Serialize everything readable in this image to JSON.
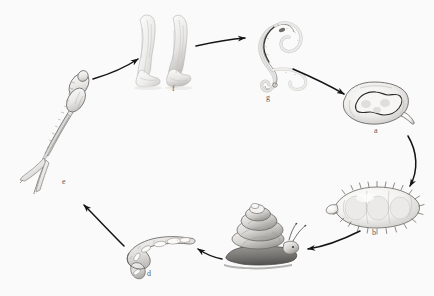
{
  "figure": {
    "background_color": "#fbfafa",
    "ink_color": "#4a4a48",
    "label_color": "#5a5a58",
    "arrow_color": "#1a1a1a",
    "cycle_direction": "clockwise",
    "stage_count": 7
  },
  "stages": [
    {
      "key": "a",
      "label": "a",
      "name": "egg",
      "description": "Operculate egg with miracidium inside",
      "label_x": 374,
      "label_y": 127
    },
    {
      "key": "b",
      "label": "b",
      "name": "miracidium",
      "description": "Ciliated free-swimming miracidium larva",
      "label_x": 372,
      "label_y": 229
    },
    {
      "key": "c",
      "label": "c",
      "name": "snail",
      "description": "Freshwater snail intermediate host",
      "label_x": 261,
      "label_y": 259
    },
    {
      "key": "d",
      "label": "d",
      "name": "sporocyst-redia",
      "description": "Sporocyst / redia stage inside snail",
      "label_x": 147,
      "label_y": 270
    },
    {
      "key": "e",
      "label": "e",
      "name": "cercaria",
      "description": "Fork-tailed cercaria free-swimming larva",
      "label_x": 62,
      "label_y": 178
    },
    {
      "key": "f",
      "label": "f",
      "name": "human-host",
      "description": "Human legs in water, definitive host entry",
      "label_x": 172,
      "label_y": 85
    },
    {
      "key": "g",
      "label": "g",
      "name": "adult-fluke",
      "description": "Adult fluke worm pair in definitive host",
      "label_x": 266,
      "label_y": 94
    }
  ],
  "arrows": [
    {
      "name": "arrow-e-to-f",
      "from": "e",
      "to": "f"
    },
    {
      "name": "arrow-f-to-g",
      "from": "f",
      "to": "g"
    },
    {
      "name": "arrow-g-to-a",
      "from": "g",
      "to": "a"
    },
    {
      "name": "arrow-a-to-b",
      "from": "a",
      "to": "b"
    },
    {
      "name": "arrow-b-to-c",
      "from": "b",
      "to": "c"
    },
    {
      "name": "arrow-c-to-d",
      "from": "c",
      "to": "d"
    },
    {
      "name": "arrow-d-to-e",
      "from": "d",
      "to": "e"
    }
  ]
}
